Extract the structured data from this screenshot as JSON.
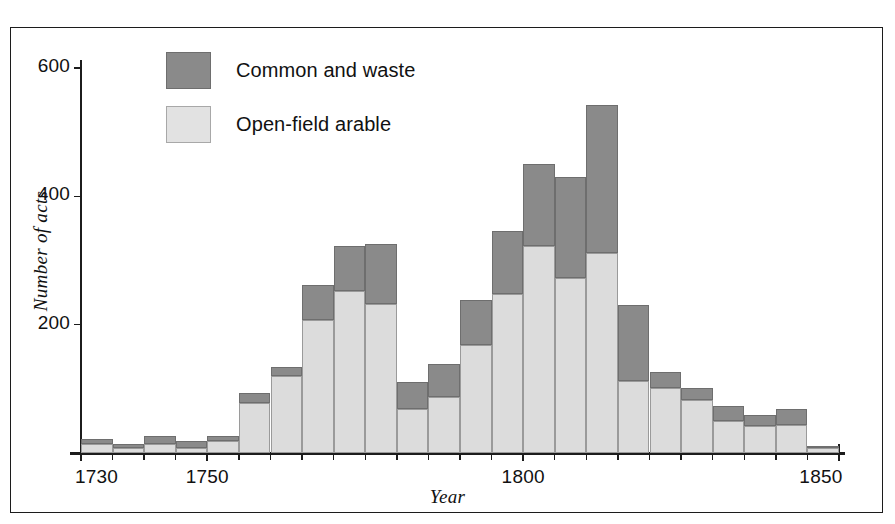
{
  "chart_data": {
    "type": "bar",
    "title": "",
    "subtitle": "",
    "xlabel": "Year",
    "ylabel": "Number of acts",
    "stacked": true,
    "grid": false,
    "legend_position": "top-left",
    "xlim": [
      1730,
      1850
    ],
    "ylim": [
      0,
      620
    ],
    "bin_width": 5,
    "x_tick_labels": [
      "1730",
      "1750",
      "1800",
      "1850"
    ],
    "x_tick_values": [
      1730,
      1750,
      1800,
      1850
    ],
    "y_tick_labels": [
      "200",
      "400",
      "600"
    ],
    "y_tick_values": [
      200,
      400,
      600
    ],
    "categories": [
      "1730",
      "1735",
      "1740",
      "1745",
      "1750",
      "1755",
      "1760",
      "1765",
      "1770",
      "1775",
      "1780",
      "1785",
      "1790",
      "1795",
      "1800",
      "1805",
      "1810",
      "1815",
      "1820",
      "1825",
      "1830",
      "1835",
      "1840",
      "1845"
    ],
    "series": [
      {
        "name": "Open-field arable",
        "color": "#dcdcdc",
        "values": [
          14,
          8,
          14,
          8,
          18,
          78,
          120,
          208,
          252,
          232,
          68,
          88,
          168,
          248,
          322,
          272,
          312,
          112,
          102,
          82,
          50,
          42,
          44,
          8
        ]
      },
      {
        "name": "Common and waste",
        "color": "#8a8a8a",
        "values": [
          8,
          6,
          12,
          10,
          8,
          16,
          14,
          54,
          70,
          94,
          42,
          50,
          70,
          98,
          128,
          158,
          230,
          118,
          24,
          20,
          24,
          18,
          24,
          3
        ]
      }
    ],
    "totals": [
      22,
      14,
      26,
      18,
      26,
      94,
      134,
      262,
      322,
      326,
      110,
      138,
      238,
      346,
      450,
      430,
      542,
      230,
      126,
      102,
      74,
      60,
      68,
      11
    ]
  },
  "legend": {
    "items": [
      {
        "label": "Common and waste",
        "swatch": "dark"
      },
      {
        "label": "Open-field arable",
        "swatch": "light"
      }
    ]
  },
  "axis": {
    "x_title": "Year",
    "y_title": "Number of acts"
  }
}
